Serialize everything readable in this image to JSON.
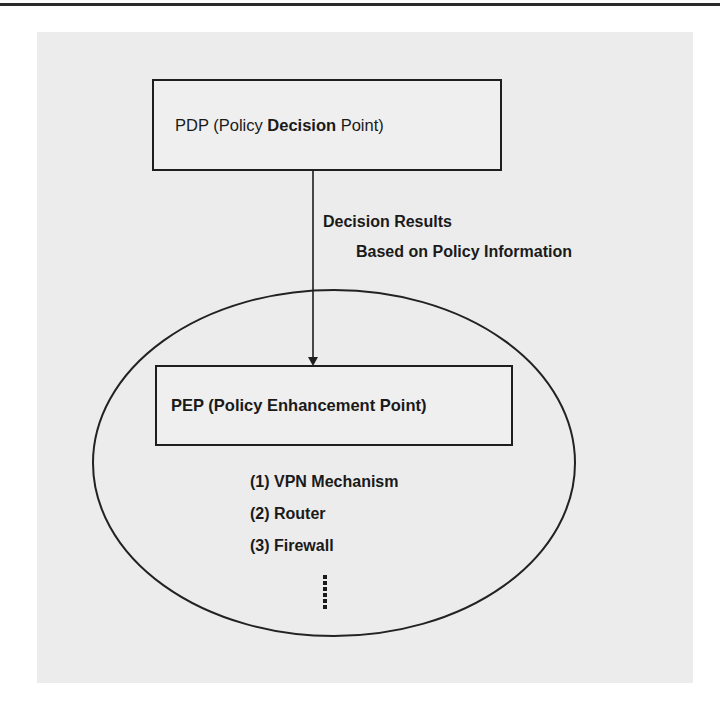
{
  "diagram": {
    "nodes": {
      "pdp": {
        "label_prefix": "PDP (Policy ",
        "label_bold": "Decision",
        "label_suffix": " Point)"
      },
      "pep": {
        "label": "PEP (Policy Enhancement Point)"
      }
    },
    "edge": {
      "from": "pdp",
      "to": "pep",
      "label_line1": "Decision Results",
      "label_line2": "Based on Policy Information"
    },
    "pep_examples": [
      {
        "label": "(1) VPN Mechanism"
      },
      {
        "label": "(2) Router"
      },
      {
        "label": "(3) Firewall"
      }
    ],
    "continuation_marker": "vertical-ellipsis"
  },
  "colors": {
    "line": "#1e1e1e",
    "panel_background": "#ececec",
    "page_background": "#ffffff"
  }
}
